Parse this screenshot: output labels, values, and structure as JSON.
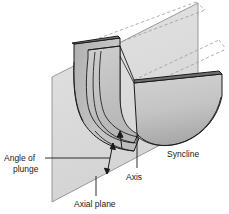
{
  "figure": {
    "background_color": "#ffffff",
    "width": 229,
    "height": 214
  },
  "labels": {
    "angle_of_plunge_line1": "Angle of",
    "angle_of_plunge_line2": "plunge",
    "axial_plane": "Axial plane",
    "axis": "Axis",
    "syncline": "Syncline"
  },
  "colors": {
    "outline": "#1a1a1a",
    "plane_fill": "#cfcfcf",
    "plane_edge": "#8f8f8f",
    "rock_light": "#c9c9c9",
    "rock_mid": "#b4b4b4",
    "rock_dark": "#8a8a8a",
    "rock_darker": "#6e6e6e",
    "rock_top": "#9a9a9a",
    "dashed": "#9a9a9a",
    "text": "#1a1a1a"
  },
  "elements": {
    "axial_plane_name": "axial-plane-parallelogram",
    "fold_body_name": "syncline-fold-block",
    "dashed_upper_name": "upper-projection-dashed-lines",
    "dashed_lower_name": "lower-projection-dashed-lines",
    "plunge_arrow_name": "plunge-angle-double-arrow",
    "axis_arrow_name": "fold-axis-arrow"
  }
}
